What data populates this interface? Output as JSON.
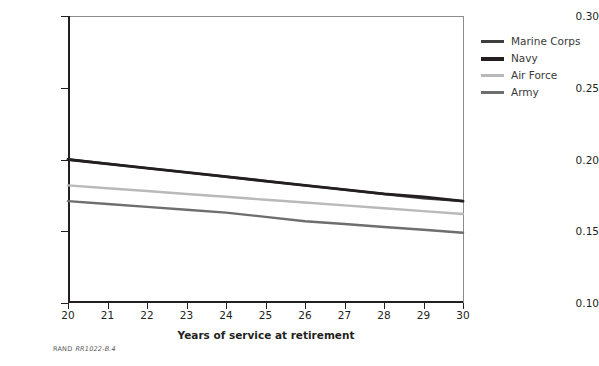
{
  "chart_data": {
    "type": "line",
    "title": "",
    "xlabel": "Years of service at retirement",
    "ylabel": "",
    "x": [
      20,
      21,
      22,
      23,
      24,
      25,
      26,
      27,
      28,
      29,
      30
    ],
    "xlim": [
      20,
      30
    ],
    "ylim": [
      0.1,
      0.3
    ],
    "xticks": [
      "20",
      "21",
      "22",
      "23",
      "24",
      "25",
      "26",
      "27",
      "28",
      "29",
      "30"
    ],
    "yticks": [
      "0.10",
      "0.15",
      "0.20",
      "0.25",
      "0.30"
    ],
    "ytick_values": [
      0.1,
      0.15,
      0.2,
      0.25,
      0.3
    ],
    "grid": false,
    "legend_position": "right-top",
    "series": [
      {
        "name": "Marine Corps",
        "color": "#3f3f3f",
        "width": 2.4,
        "values": [
          0.2,
          0.197,
          0.194,
          0.191,
          0.188,
          0.185,
          0.182,
          0.179,
          0.176,
          0.173,
          0.171
        ]
      },
      {
        "name": "Navy",
        "color": "#231f20",
        "width": 2.8,
        "values": [
          0.2,
          0.197,
          0.194,
          0.191,
          0.188,
          0.185,
          0.182,
          0.179,
          0.176,
          0.174,
          0.171
        ]
      },
      {
        "name": "Air Force",
        "color": "#b9b9b9",
        "width": 2.4,
        "values": [
          0.182,
          0.18,
          0.178,
          0.176,
          0.174,
          0.172,
          0.17,
          0.168,
          0.166,
          0.164,
          0.162
        ]
      },
      {
        "name": "Army",
        "color": "#6e6e6e",
        "width": 2.4,
        "values": [
          0.171,
          0.169,
          0.167,
          0.165,
          0.163,
          0.16,
          0.157,
          0.155,
          0.153,
          0.151,
          0.149
        ]
      }
    ]
  },
  "legend": {
    "items": [
      {
        "label": "Marine Corps",
        "color": "#3f3f3f",
        "thickness": "3px"
      },
      {
        "label": "Navy",
        "color": "#231f20",
        "thickness": "4px"
      },
      {
        "label": "Air Force",
        "color": "#b9b9b9",
        "thickness": "3px"
      },
      {
        "label": "Army",
        "color": "#6e6e6e",
        "thickness": "3px"
      }
    ]
  },
  "footer": {
    "rand": "RAND",
    "doc_id": "RR1022-B.4"
  }
}
